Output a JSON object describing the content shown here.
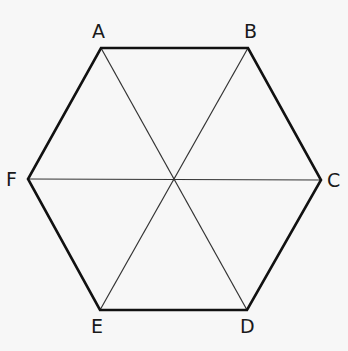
{
  "diagram": {
    "type": "regular-hexagon",
    "vertices": [
      {
        "label": "A",
        "x": 101,
        "y": 48
      },
      {
        "label": "B",
        "x": 248,
        "y": 48
      },
      {
        "label": "C",
        "x": 321,
        "y": 180
      },
      {
        "label": "D",
        "x": 247,
        "y": 310
      },
      {
        "label": "E",
        "x": 100,
        "y": 310
      },
      {
        "label": "F",
        "x": 28,
        "y": 179
      }
    ],
    "diagonals": [
      [
        "A",
        "D"
      ],
      [
        "B",
        "E"
      ],
      [
        "C",
        "F"
      ]
    ],
    "labels": {
      "A": "A",
      "B": "B",
      "C": "C",
      "D": "D",
      "E": "E",
      "F": "F"
    },
    "colors": {
      "edge": "#111111",
      "diagonal": "#333333",
      "background": "#f7f7f7"
    }
  }
}
